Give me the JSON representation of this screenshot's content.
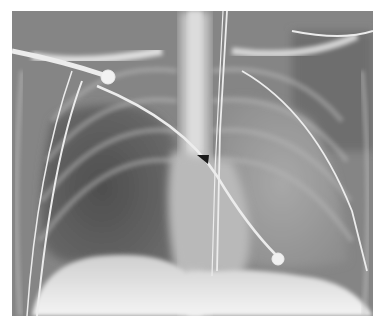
{
  "figure": {
    "type": "chest-radiograph",
    "view": "frontal",
    "annotations": [
      {
        "type": "arrowhead",
        "color": "#1a1a1a",
        "x": 202,
        "y": 159
      }
    ],
    "colors": {
      "background": "#ffffff",
      "film_mid": "#8a8a8a",
      "lung_dark": "#4a4a4a",
      "bone_bright": "#e8e8e8"
    }
  }
}
